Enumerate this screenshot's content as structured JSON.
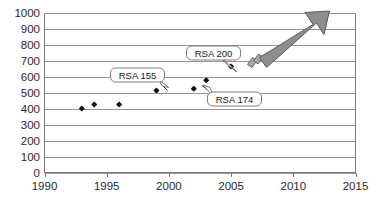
{
  "chart_data": {
    "type": "scatter",
    "title": "",
    "subtitle": "",
    "xlabel": "",
    "ylabel": "",
    "xlim": [
      1990,
      2015
    ],
    "ylim": [
      0,
      1000
    ],
    "grid": true,
    "legend": null,
    "x_ticks": [
      "1990",
      "1995",
      "2000",
      "2005",
      "2010",
      "2015"
    ],
    "x_tick_values": [
      1990,
      1995,
      2000,
      2005,
      2010,
      2015
    ],
    "y_ticks": [
      "0",
      "100",
      "200",
      "300",
      "400",
      "500",
      "600",
      "700",
      "800",
      "900",
      "1000"
    ],
    "y_tick_values": [
      0,
      100,
      200,
      300,
      400,
      500,
      600,
      700,
      800,
      900,
      1000
    ],
    "points": [
      {
        "x": 1993,
        "y": 400,
        "label": ""
      },
      {
        "x": 1994,
        "y": 425,
        "label": ""
      },
      {
        "x": 1996,
        "y": 425,
        "label": ""
      },
      {
        "x": 1999,
        "y": 512,
        "label": "RSA 155"
      },
      {
        "x": 2002,
        "y": 524,
        "label": "RSA 174"
      },
      {
        "x": 2003,
        "y": 576,
        "label": ""
      },
      {
        "x": 2005,
        "y": 663,
        "label": "RSA 200"
      }
    ],
    "annotations": [
      {
        "name": "RSA 155",
        "text": "RSA 155",
        "target_x": 1999,
        "target_y": 512
      },
      {
        "name": "RSA 174",
        "text": "RSA 174",
        "target_x": 2002,
        "target_y": 524
      },
      {
        "name": "RSA 200",
        "text": "RSA 200",
        "target_x": 2005,
        "target_y": 663
      },
      {
        "name": "trend-arrow",
        "text": "",
        "target_x": 2012,
        "target_y": 1000
      }
    ],
    "colors": {
      "point": "#111111",
      "gridline": "#8c8c8c",
      "axis": "#7a7a7a",
      "arrow_fill": "#8e8e8e",
      "arrow_stroke": "#4f4f4f",
      "callout_fill": "#ffffff",
      "callout_stroke": "#6f6f6f",
      "text": "#2b2b2b",
      "background": "#ffffff"
    }
  },
  "callouts": {
    "rsa155": "RSA 155",
    "rsa174": "RSA 174",
    "rsa200": "RSA 200"
  },
  "axis": {
    "y_labels": [
      "1000",
      "900",
      "800",
      "700",
      "600",
      "500",
      "400",
      "300",
      "200",
      "100",
      "0"
    ],
    "x_labels": [
      "1990",
      "1995",
      "2000",
      "2005",
      "2010",
      "2015"
    ]
  }
}
